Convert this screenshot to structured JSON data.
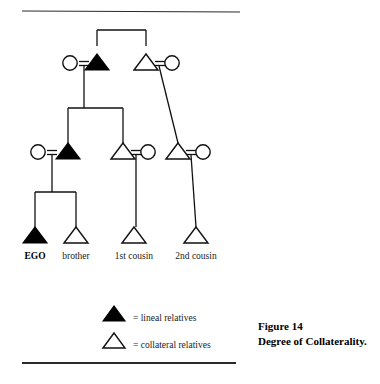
{
  "figure": {
    "caption_line1": "Figure 14",
    "caption_line2": "Degree of Collaterality."
  },
  "rules": {
    "top": {
      "x1": 22,
      "y1": 11,
      "x2": 240,
      "y2": 12,
      "width": 1.1
    },
    "bottom": {
      "x1": 22,
      "y1": 363,
      "x2": 236,
      "y2": 363,
      "width": 2.0
    }
  },
  "colors": {
    "lineal_fill": "#000000",
    "collateral_fill": "#ffffff",
    "stroke": "#111111",
    "rule": "#2b2b2b",
    "background": "#ffffff"
  },
  "diagram": {
    "type": "kinship-chart",
    "symbol_legend": {
      "triangle": "male",
      "circle": "female",
      "double_line": "marriage-tie",
      "filled": "lineal relative",
      "open": "collateral relative"
    },
    "generations": [
      {
        "id": "g1",
        "name": "grandparent-generation",
        "baseline_y": 70,
        "nodes": [
          {
            "id": "g1-f",
            "shape": "circle",
            "fill": "open",
            "cx": 70,
            "cy": 63,
            "r": 7.2,
            "role": "grandmother"
          },
          {
            "id": "g1-m",
            "shape": "triangle",
            "fill": "filled",
            "cx": 97,
            "base_y": 70,
            "half_w": 12,
            "height": 16,
            "role": "grandfather-lineal"
          },
          {
            "id": "g1-gu",
            "shape": "triangle",
            "fill": "open",
            "cx": 146,
            "base_y": 70,
            "half_w": 12,
            "height": 16,
            "role": "granduncle"
          },
          {
            "id": "g1-ga",
            "shape": "circle",
            "fill": "open",
            "cx": 172,
            "cy": 63,
            "r": 7.2,
            "role": "grandaunt"
          }
        ]
      },
      {
        "id": "g2",
        "name": "parent-generation",
        "baseline_y": 159,
        "nodes": [
          {
            "id": "g2-m",
            "shape": "circle",
            "fill": "open",
            "cx": 38,
            "cy": 152,
            "r": 7.2,
            "role": "mother"
          },
          {
            "id": "g2-f",
            "shape": "triangle",
            "fill": "filled",
            "cx": 68,
            "base_y": 159,
            "half_w": 12,
            "height": 16,
            "role": "father-lineal"
          },
          {
            "id": "g2-u",
            "shape": "triangle",
            "fill": "open",
            "cx": 123,
            "base_y": 159,
            "half_w": 12,
            "height": 16,
            "role": "uncle"
          },
          {
            "id": "g2-ua",
            "shape": "circle",
            "fill": "open",
            "cx": 148,
            "cy": 152,
            "r": 7.2,
            "role": "aunt"
          },
          {
            "id": "g2-c1",
            "shape": "triangle",
            "fill": "open",
            "cx": 178,
            "base_y": 159,
            "half_w": 12,
            "height": 16,
            "role": "first-cousin-once-removed"
          },
          {
            "id": "g2-c1s",
            "shape": "circle",
            "fill": "open",
            "cx": 203,
            "cy": 152,
            "r": 7.2,
            "role": "cousin-spouse"
          }
        ]
      },
      {
        "id": "g3",
        "name": "ego-generation",
        "baseline_y": 243,
        "nodes": [
          {
            "id": "g3-ego",
            "shape": "triangle",
            "fill": "filled",
            "cx": 35,
            "base_y": 243,
            "half_w": 12,
            "height": 16,
            "role": "ego-lineal",
            "label": "EGO",
            "label_bold": true
          },
          {
            "id": "g3-bro",
            "shape": "triangle",
            "fill": "open",
            "cx": 76,
            "base_y": 243,
            "half_w": 12,
            "height": 16,
            "role": "brother",
            "label": "brother",
            "label_bold": false
          },
          {
            "id": "g3-c1",
            "shape": "triangle",
            "fill": "open",
            "cx": 134,
            "base_y": 243,
            "half_w": 12,
            "height": 16,
            "role": "first-cousin",
            "label": "1st cousin",
            "label_bold": false
          },
          {
            "id": "g3-c2",
            "shape": "triangle",
            "fill": "open",
            "cx": 196,
            "base_y": 243,
            "half_w": 12,
            "height": 16,
            "role": "second-cousin",
            "label": "2nd cousin",
            "label_bold": false
          }
        ]
      }
    ],
    "labels_y": 259,
    "marriage_ties": [
      {
        "id": "tie-g1-left",
        "x1": 79,
        "x2": 89,
        "y": 61.5,
        "y2": 65.5,
        "descent_x": 84
      },
      {
        "id": "tie-g1-right",
        "x1": 155,
        "x2": 165,
        "y": 61.5,
        "y2": 65.5,
        "descent_x": 159
      },
      {
        "id": "tie-g2-left",
        "x1": 47,
        "x2": 57,
        "y": 150.5,
        "y2": 154.5,
        "descent_x": 52
      },
      {
        "id": "tie-g2-mid",
        "x1": 131,
        "x2": 141,
        "y": 150.5,
        "y2": 154.5,
        "descent_x": 136
      },
      {
        "id": "tie-g2-right",
        "x1": 186,
        "x2": 196,
        "y": 150.5,
        "y2": 154.5,
        "descent_x": 191
      }
    ],
    "connectors": [
      {
        "id": "sib-bar-g1",
        "type": "sibling-bar",
        "x1": 97,
        "x2": 146,
        "y": 30,
        "drop_to": 46
      },
      {
        "id": "sib-bar-g2",
        "type": "sibling-bar",
        "x1": 68,
        "x2": 123,
        "y": 108,
        "drop_to": 143
      },
      {
        "id": "sib-bar-g3",
        "type": "sibling-bar",
        "x1": 35,
        "x2": 76,
        "y": 192,
        "drop_to": 227
      },
      {
        "id": "desc-g1-left",
        "type": "descent-vertical",
        "x": 84,
        "y1": 66,
        "y2": 108
      },
      {
        "id": "desc-g2-left",
        "type": "descent-vertical",
        "x": 52,
        "y1": 155,
        "y2": 192
      },
      {
        "id": "desc-g2-mid",
        "type": "descent-vertical",
        "x": 136,
        "y1": 155,
        "y2": 227
      },
      {
        "id": "desc-g1-right",
        "type": "descent-diagonal",
        "x1": 159,
        "y1": 66,
        "x2": 178,
        "y2": 143
      },
      {
        "id": "desc-g2-right",
        "type": "descent-diagonal",
        "x1": 191,
        "y1": 155,
        "x2": 196,
        "y2": 227
      }
    ]
  },
  "legend": {
    "items": [
      {
        "id": "legend-lineal",
        "symbol": "triangle-filled",
        "fill": "filled",
        "cx": 114,
        "base_y": 321,
        "half_w": 11,
        "height": 15,
        "text": "= lineal relatives",
        "text_x": 133,
        "text_y": 321
      },
      {
        "id": "legend-collateral",
        "symbol": "triangle-open",
        "fill": "open",
        "cx": 114,
        "base_y": 348,
        "half_w": 11,
        "height": 15,
        "text": "= collateral relatives",
        "text_x": 133,
        "text_y": 348
      }
    ]
  },
  "caption_layout": {
    "x": 258,
    "y1": 330,
    "y2": 345
  }
}
